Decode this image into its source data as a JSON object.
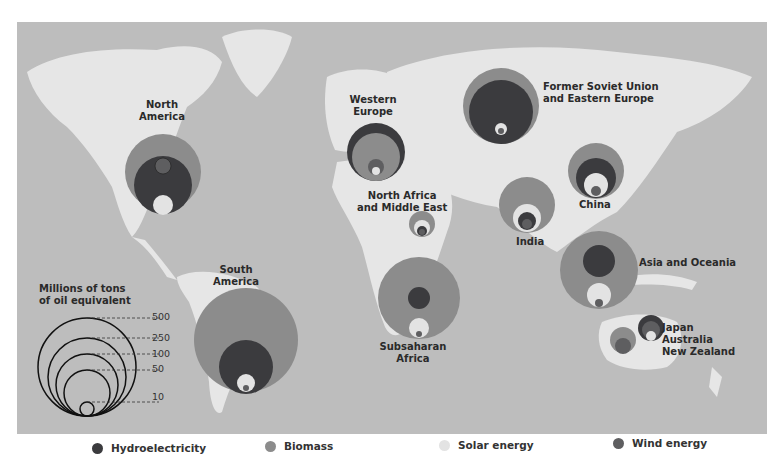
{
  "map": {
    "title_hidden": "",
    "colors": {
      "ocean": "#bdbdbd",
      "land": "#e6e6e6",
      "hydro": "#3b3b3e",
      "biomass": "#8c8c8c",
      "solar": "#e3e3e3",
      "wind": "#5e5e60"
    },
    "regions": [
      {
        "id": "north-america",
        "label": "North\nAmerica",
        "hydro": "large",
        "biomass": "large",
        "solar": "small",
        "wind": "small"
      },
      {
        "id": "western-europe",
        "label": "Western\nEurope",
        "hydro": "large",
        "biomass": "large",
        "solar": "small",
        "wind": "small"
      },
      {
        "id": "former-soviet-union",
        "label": "Former Soviet Union\nand Eastern Europe",
        "hydro": "large",
        "biomass": "large",
        "solar": "very small",
        "wind": "very small"
      },
      {
        "id": "china",
        "label": "China",
        "hydro": "medium",
        "biomass": "large",
        "solar": "small",
        "wind": "small"
      },
      {
        "id": "india",
        "label": "India",
        "hydro": "small",
        "biomass": "medium",
        "solar": "small",
        "wind": "small"
      },
      {
        "id": "north-africa-middle-east",
        "label": "North Africa\nand Middle East",
        "hydro": "small",
        "biomass": "small",
        "solar": "small",
        "wind": "very small"
      },
      {
        "id": "south-america",
        "label": "South\nAmerica",
        "hydro": "large",
        "biomass": "very large",
        "solar": "small",
        "wind": "very small"
      },
      {
        "id": "subsaharan-africa",
        "label": "Subsaharan\nAfrica",
        "hydro": "small",
        "biomass": "very large",
        "solar": "small",
        "wind": "very small"
      },
      {
        "id": "asia-oceania",
        "label": "Asia and Oceania",
        "hydro": "medium",
        "biomass": "large",
        "solar": "small",
        "wind": "very small"
      },
      {
        "id": "japan-australia-nz",
        "label": "Japan\nAustralia\nNew Zealand",
        "hydro": "small",
        "biomass": "small",
        "solar": "small",
        "wind": "small"
      }
    ]
  },
  "scale_legend": {
    "title": "Millions of tons\nof oil equivalent",
    "values": [
      "500",
      "250",
      "100",
      "50",
      "10"
    ]
  },
  "legend": {
    "items": [
      {
        "label": "Hydroelectricity",
        "color": "#3b3b3e"
      },
      {
        "label": "Biomass",
        "color": "#8c8c8c"
      },
      {
        "label": "Solar energy",
        "color": "#e3e3e3"
      },
      {
        "label": "Wind energy",
        "color": "#5e5e60"
      }
    ]
  }
}
